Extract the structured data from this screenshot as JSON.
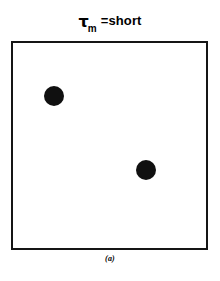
{
  "figure": {
    "title": {
      "symbol": "τ",
      "subscript": "m",
      "relation_and_value": "=short",
      "full_text": "τm =short"
    },
    "caption": "(a)",
    "colors": {
      "background": "#ffffff",
      "border": "#151515",
      "marker": "#101010"
    }
  },
  "chart_data": {
    "type": "scatter",
    "subtitle": "",
    "xlabel": "",
    "ylabel": "",
    "annotations": [
      "(a)"
    ],
    "grid": false,
    "legend": null,
    "xlim": [
      0,
      100
    ],
    "ylim": [
      0,
      100
    ],
    "xticks": [],
    "yticks": [],
    "marker_style": "filled-circle",
    "marker_color": "#101010",
    "marker_size_px": 20,
    "points": [
      {
        "x": 21,
        "y": 74,
        "label": ""
      },
      {
        "x": 69,
        "y": 38,
        "label": ""
      }
    ],
    "series": [
      {
        "name": "markers",
        "x": [
          21,
          69
        ],
        "y": [
          74,
          38
        ]
      }
    ]
  }
}
